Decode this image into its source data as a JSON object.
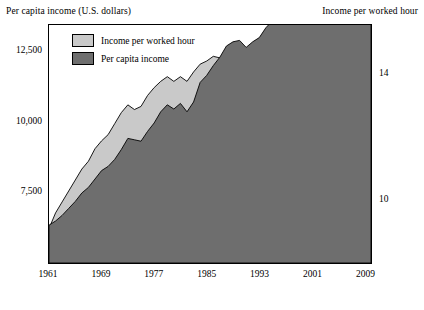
{
  "titles": {
    "left": "Per capita income (U.S. dollars)",
    "right": "Income per worked hour"
  },
  "legend": [
    {
      "label": "Income per worked hour",
      "color": "#c9c9c9"
    },
    {
      "label": "Per capita income",
      "color": "#6e6e6e"
    }
  ],
  "axes": {
    "y_left_ticks": [
      "12,500",
      "10,000",
      "7,500"
    ],
    "y_right_ticks": [
      "14",
      "10"
    ],
    "x_ticks": [
      "1961",
      "1969",
      "1977",
      "1985",
      "1993",
      "2001",
      "2009"
    ]
  },
  "chart_data": {
    "type": "area",
    "title": "",
    "subtitle": "",
    "xlabel": "",
    "ylabel": "Per capita income (U.S. dollars)",
    "y2label": "Income per worked hour",
    "grid": false,
    "legend_position": "top-left-inside",
    "x": [
      1961,
      1962,
      1963,
      1964,
      1965,
      1966,
      1967,
      1968,
      1969,
      1970,
      1971,
      1972,
      1973,
      1974,
      1975,
      1976,
      1977,
      1978,
      1979,
      1980,
      1981,
      1982,
      1983,
      1984,
      1985,
      1986,
      1987,
      1988,
      1989,
      1990,
      1991,
      1992,
      1993,
      1994,
      1995,
      1996,
      1997,
      1998,
      1999,
      2000,
      2001,
      2002,
      2003,
      2004,
      2005,
      2006,
      2007,
      2008,
      2009,
      2010
    ],
    "xlim": [
      1961,
      2010
    ],
    "ylim_left": [
      5000,
      13500
    ],
    "ylim_right": [
      8.0,
      15.6
    ],
    "series": [
      {
        "name": "Per capita income",
        "color": "#6e6e6e",
        "axis": "left",
        "values": [
          6350,
          6500,
          6700,
          6950,
          7200,
          7500,
          7700,
          8000,
          8300,
          8450,
          8700,
          9050,
          9450,
          9400,
          9350,
          9700,
          10000,
          10400,
          10650,
          10500,
          10700,
          10400,
          10750,
          11450,
          11700,
          12050,
          12350,
          12750,
          12900,
          12950,
          12700,
          12900,
          13050,
          13400,
          13650,
          14000,
          14450,
          14900,
          15350,
          15800,
          15800,
          15950,
          16300,
          16750,
          17200,
          17650,
          17900,
          17600,
          16950,
          17000
        ]
      },
      {
        "name": "Income per worked hour",
        "color": "#c9c9c9",
        "axis": "right",
        "values": [
          9.1,
          9.6,
          9.95,
          10.3,
          10.65,
          11.0,
          11.25,
          11.65,
          11.9,
          12.1,
          12.45,
          12.8,
          13.05,
          12.9,
          13.0,
          13.35,
          13.6,
          13.8,
          13.95,
          13.8,
          13.95,
          13.8,
          14.1,
          14.35,
          14.45,
          14.6,
          14.55,
          14.6,
          14.55,
          14.6,
          14.7,
          15.0,
          14.95,
          15.0,
          15.05,
          15.25,
          15.4,
          15.65,
          15.85,
          16.0,
          16.05,
          16.35,
          16.7,
          17.0,
          17.1,
          17.2,
          17.3,
          17.35,
          17.6,
          17.8
        ]
      }
    ],
    "note": "Two overlapping filled areas plotted on dual axes; light gray area (income per worked hour, right axis) and dark gray area (per capita income, left axis) cross around 1982."
  }
}
